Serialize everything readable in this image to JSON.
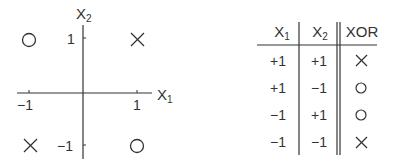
{
  "plot": {
    "x_axis_label": "X",
    "x_axis_sub": "1",
    "y_axis_label": "X",
    "y_axis_sub": "2",
    "x_ticks": [
      "−1",
      "1"
    ],
    "y_ticks": [
      "1",
      "−1"
    ],
    "points": [
      {
        "x": -1,
        "y": 1,
        "marker": "circle"
      },
      {
        "x": 1,
        "y": 1,
        "marker": "cross"
      },
      {
        "x": -1,
        "y": -1,
        "marker": "cross"
      },
      {
        "x": 1,
        "y": -1,
        "marker": "circle"
      }
    ]
  },
  "table": {
    "headers": [
      {
        "label": "X",
        "sub": "1"
      },
      {
        "label": "X",
        "sub": "2"
      },
      {
        "label": "XOR",
        "sub": ""
      }
    ],
    "rows": [
      {
        "x1": "+1",
        "x2": "+1",
        "xor": "cross"
      },
      {
        "x1": "+1",
        "x2": "−1",
        "xor": "circle"
      },
      {
        "x1": "−1",
        "x2": "+1",
        "xor": "circle"
      },
      {
        "x1": "−1",
        "x2": "−1",
        "xor": "cross"
      }
    ]
  }
}
